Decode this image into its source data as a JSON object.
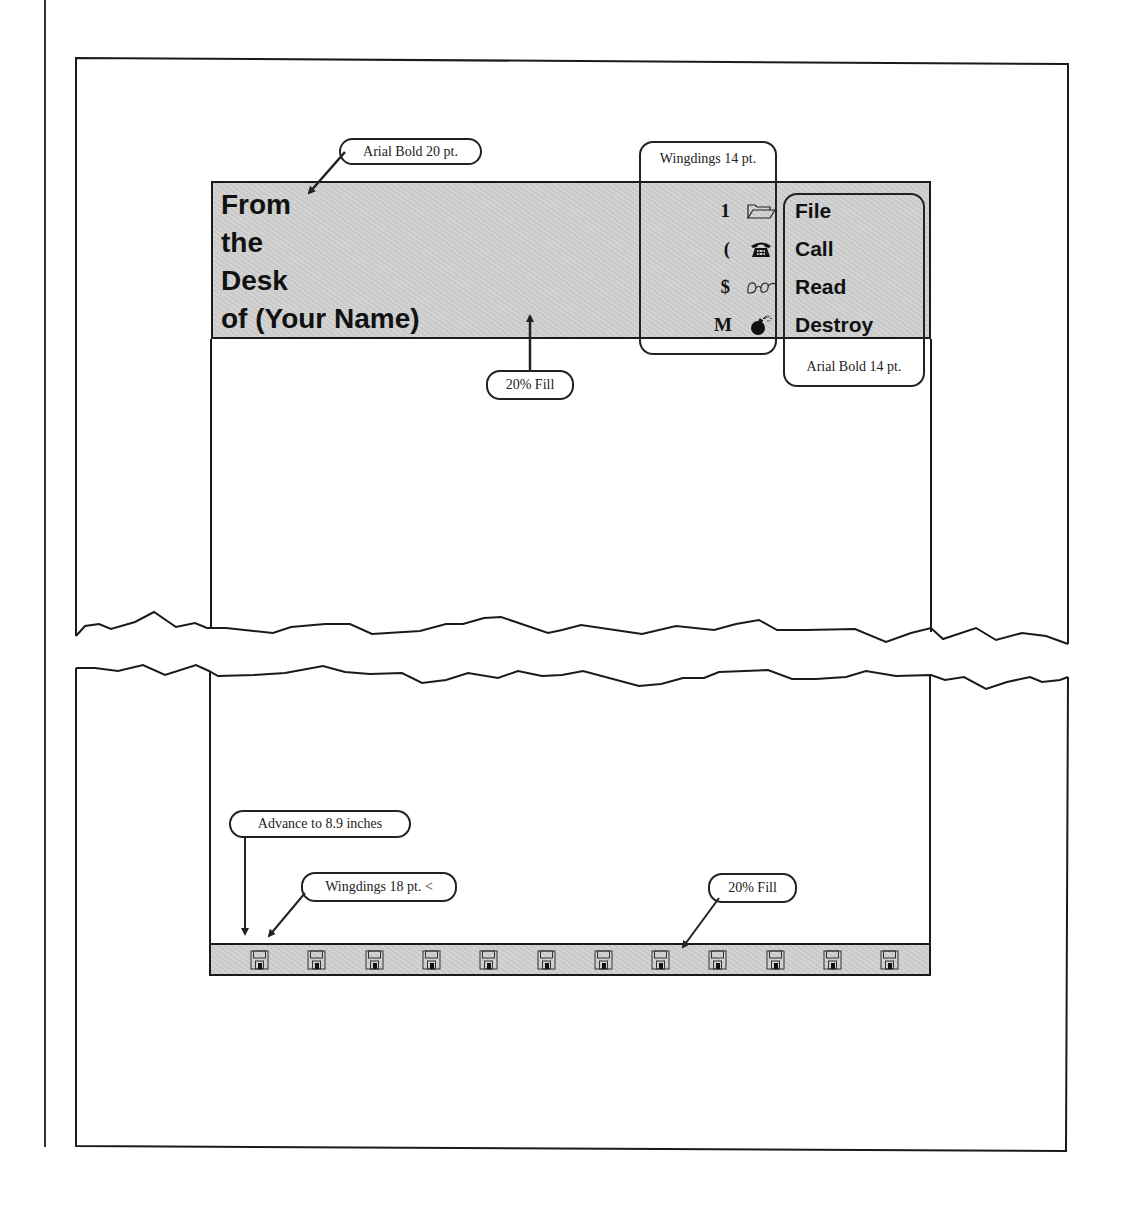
{
  "document": {
    "heading_lines": [
      "From",
      "the",
      "Desk",
      "of (Your Name)"
    ],
    "menu_items": [
      {
        "key": "1",
        "icon": "open-folder-icon",
        "label": "File"
      },
      {
        "key": "(",
        "icon": "telephone-icon",
        "label": "Call"
      },
      {
        "key": "$",
        "icon": "eyeglasses-icon",
        "label": "Read"
      },
      {
        "key": "M",
        "icon": "bomb-icon",
        "label": "Destroy"
      }
    ],
    "footer_icon": "floppy-disk-icon",
    "footer_icon_count": 12,
    "fill_color": "#cfcfcf"
  },
  "callouts": {
    "heading_font": "Arial Bold 20 pt.",
    "wingdings_font": "Wingdings 14 pt.",
    "menu_font": "Arial Bold 14 pt.",
    "banner_fill": "20% Fill",
    "advance": "Advance to 8.9 inches",
    "footer_wingdings": "Wingdings 18 pt. <",
    "footer_fill": "20% Fill"
  }
}
